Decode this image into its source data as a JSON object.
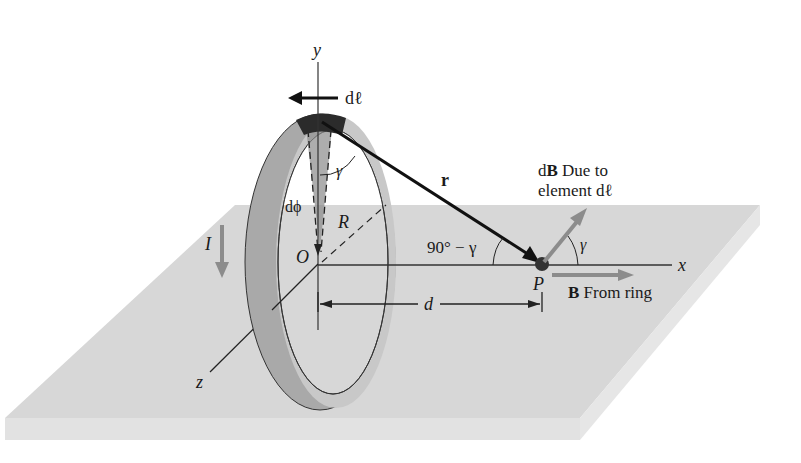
{
  "figure": {
    "axes": {
      "x": "x",
      "y": "y",
      "z": "z"
    },
    "origin_label": "O",
    "point_label": "P",
    "radius_label": "R",
    "distance_label": "d",
    "current_label": "I",
    "element_label": "dℓ",
    "dphi_label": "dϕ",
    "r_vector_label": "r",
    "gamma_label": "γ",
    "complement_angle_label": "90° − γ",
    "dB_label_line1_prefix": "d",
    "dB_label_line1_bold": "B",
    "dB_label_line1_suffix": " Due to",
    "dB_label_line2": "element dℓ",
    "B_label_bold": "B",
    "B_label_suffix": " From ring"
  },
  "colors": {
    "plane": "#d6d6d6",
    "plane_edge": "#c4c4c4",
    "ring_front": "#9a9a9a",
    "ring_back": "#c2c2c2",
    "element_dark": "#2b2b2b",
    "arrow_gray": "#8c8c8c",
    "ink": "#1a1a1a"
  }
}
